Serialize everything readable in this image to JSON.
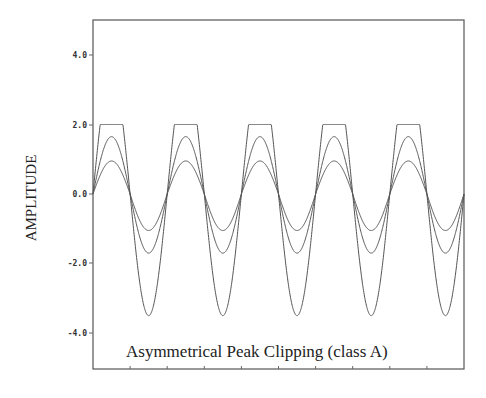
{
  "chart_data": {
    "type": "line",
    "title": "Asymmetrical Peak Clipping (class A)",
    "xlabel": "",
    "ylabel": "AMPLITUDE",
    "ylim": [
      -5.1,
      5.0
    ],
    "yticks": [
      4.0,
      2.0,
      0.0,
      -2.0,
      -4.0
    ],
    "ytick_labels": [
      "4.0",
      "2.0",
      "0.0",
      "-2.0",
      "-4.0"
    ],
    "xticks_count": 10,
    "xtick_labels": [],
    "grid": false,
    "legend": null,
    "periods": 5,
    "series": [
      {
        "name": "small amplitude",
        "positive_peak": 0.95,
        "negative_peak": -1.05,
        "clip": null
      },
      {
        "name": "medium amplitude",
        "positive_peak": 1.65,
        "negative_peak": -1.7,
        "clip": null
      },
      {
        "name": "large amplitude (clipped)",
        "positive_peak": 3.5,
        "negative_peak": -3.5,
        "clip": 2.0
      }
    ]
  },
  "axis": {
    "ylabel": "AMPLITUDE",
    "ytick_labels": [
      "4.0",
      "2.0",
      "0.0",
      "-2.0",
      "-4.0"
    ]
  },
  "annotation": {
    "title": "Asymmetrical Peak Clipping (class A)"
  },
  "colors": {
    "line": "#555555",
    "text": "#222222",
    "background": "#ffffff"
  }
}
